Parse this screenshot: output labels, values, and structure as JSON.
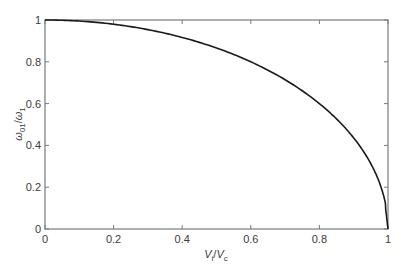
{
  "chart_data": {
    "type": "line",
    "title": "",
    "xlabel": "V_i/V_c",
    "ylabel": "ω_01/ω_1",
    "xlabel_parts": {
      "main1": "V",
      "sub1": "i",
      "sep": "/",
      "main2": "V",
      "sub2": "c"
    },
    "ylabel_parts": {
      "main1": "ω",
      "sub1": "01",
      "sep": "/",
      "main2": "ω",
      "sub2": "1"
    },
    "xlim": [
      0,
      1
    ],
    "ylim": [
      0,
      1
    ],
    "xticks": [
      0,
      0.2,
      0.4,
      0.6,
      0.8,
      1
    ],
    "yticks": [
      0,
      0.2,
      0.4,
      0.6,
      0.8,
      1
    ],
    "xtick_labels": [
      "0",
      "0.2",
      "0.4",
      "0.6",
      "0.8",
      "1"
    ],
    "ytick_labels": [
      "0",
      "0.2",
      "0.4",
      "0.6",
      "0.8",
      "1"
    ],
    "grid": false,
    "legend": null,
    "series": [
      {
        "name": "ω01/ω1",
        "color": "#1a1a1a",
        "x": [
          0,
          0.1,
          0.2,
          0.3,
          0.4,
          0.5,
          0.6,
          0.7,
          0.8,
          0.85,
          0.9,
          0.95,
          0.98,
          0.99,
          1.0
        ],
        "y": [
          1.0,
          0.995,
          0.98,
          0.954,
          0.917,
          0.866,
          0.8,
          0.714,
          0.6,
          0.527,
          0.436,
          0.312,
          0.199,
          0.141,
          0.0
        ]
      }
    ]
  },
  "colors": {
    "axis": "#7a7a7a",
    "curve": "#1a1a1a",
    "text": "#3a3a3a"
  }
}
